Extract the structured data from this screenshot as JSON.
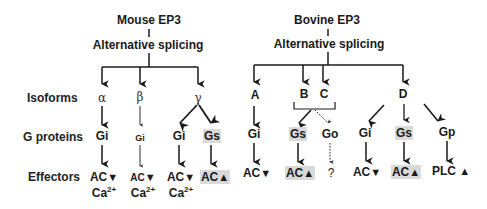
{
  "row_labels": {
    "isoforms": "Isoforms",
    "g_proteins": "G proteins",
    "effectors": "Effectors"
  },
  "mouse": {
    "title": "Mouse EP3",
    "process": "Alternative splicing",
    "isoforms": [
      "α",
      "β",
      "γ"
    ],
    "g_proteins": [
      {
        "label": "Gi",
        "isoform": "α"
      },
      {
        "label": "Gi",
        "isoform": "β",
        "size": "small"
      },
      {
        "label": "Gi",
        "isoform": "γ"
      },
      {
        "label": "Gs",
        "isoform": "γ",
        "highlight": true
      }
    ],
    "effectors": [
      {
        "label": "AC",
        "direction": "down",
        "extra": "Ca",
        "extra_sup": "2+"
      },
      {
        "label": "AC",
        "direction": "down",
        "extra": "Ca",
        "extra_sup": "2+",
        "size": "small"
      },
      {
        "label": "AC",
        "direction": "down",
        "extra": "Ca",
        "extra_sup": "2+"
      },
      {
        "label": "AC",
        "direction": "up",
        "highlight": true
      }
    ]
  },
  "bovine": {
    "title": "Bovine EP3",
    "process": "Alternative splicing",
    "isoforms": [
      "A",
      "B",
      "C",
      "D"
    ],
    "g_proteins": [
      {
        "label": "Gi",
        "isoform": "A"
      },
      {
        "label": "Gs",
        "isoform": "B/C",
        "highlight": true
      },
      {
        "label": "Go",
        "isoform": "B/C",
        "dotted": true
      },
      {
        "label": "Gi",
        "isoform": "D"
      },
      {
        "label": "Gs",
        "isoform": "D",
        "highlight": true
      },
      {
        "label": "Gp",
        "isoform": "D"
      }
    ],
    "effectors": [
      {
        "label": "AC",
        "direction": "down"
      },
      {
        "label": "AC",
        "direction": "up",
        "highlight": true
      },
      {
        "label": "?",
        "direction": "none"
      },
      {
        "label": "AC",
        "direction": "down"
      },
      {
        "label": "AC",
        "direction": "up",
        "highlight": true
      },
      {
        "label": "PLC",
        "direction": "up"
      }
    ]
  },
  "symbols": {
    "up": "▲",
    "down": "▼"
  }
}
